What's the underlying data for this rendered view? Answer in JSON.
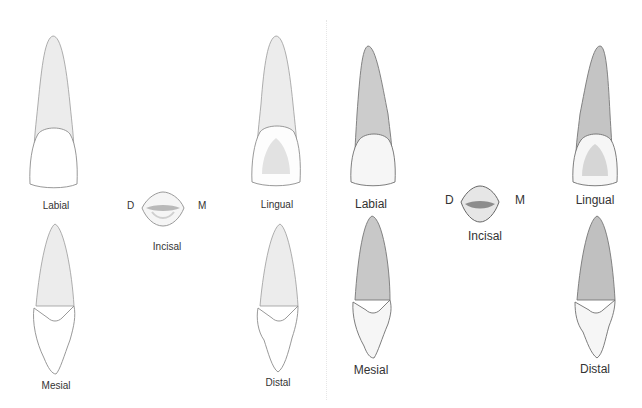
{
  "figure": {
    "left_panel": {
      "views": {
        "labial": "Labial",
        "lingual": "Lingual",
        "incisal": "Incisal",
        "mesial": "Mesial",
        "distal": "Distal"
      },
      "orientation": {
        "distal": "D",
        "mesial": "M"
      },
      "root_color": "#e9e9e9",
      "crown_color": "#ffffff"
    },
    "right_panel": {
      "views": {
        "labial": "Labial",
        "lingual": "Lingual",
        "incisal": "Incisal",
        "mesial": "Mesial",
        "distal": "Distal"
      },
      "orientation": {
        "distal": "D",
        "mesial": "M"
      },
      "root_color": "#c9c9c9",
      "crown_color": "#f4f4f4"
    }
  }
}
